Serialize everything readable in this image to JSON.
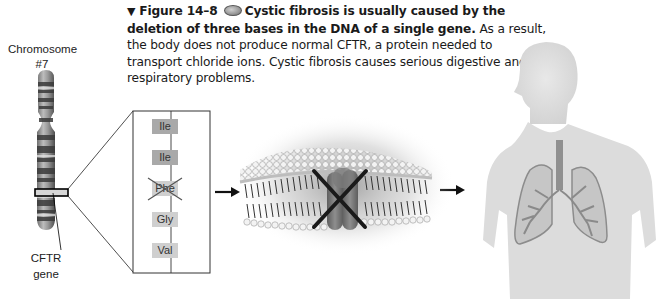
{
  "caption": {
    "marker": "▼",
    "figure_label": "Figure 14–8",
    "icon": "lens-icon",
    "bold_text": "Cystic fibrosis is usually caused by the deletion of three bases in the DNA of a single gene.",
    "body_text": " As a result, the body does not produce normal CFTR, a protein needed to transport chloride ions. Cystic fibrosis causes serious digestive and respiratory problems."
  },
  "chromosome": {
    "title_line1": "Chromosome",
    "title_line2": "#7",
    "gene_label_line1": "CFTR",
    "gene_label_line2": "gene"
  },
  "gene_panel": {
    "amino_acids": [
      {
        "label": "Ile",
        "deleted": false
      },
      {
        "label": "Ile",
        "deleted": false
      },
      {
        "label": "Phe",
        "deleted": true
      },
      {
        "label": "Gly",
        "deleted": false
      },
      {
        "label": "Val",
        "deleted": false
      }
    ]
  },
  "membrane": {
    "description": "cell membrane lipid bilayer with crossed-out CFTR channel protein"
  },
  "body": {
    "description": "human torso with lungs and airways"
  },
  "colors": {
    "text": "#1a1a1a",
    "aa_dark": "#a9a9a9",
    "aa_light": "#cfcfcf",
    "cross": "#1a1a1a"
  }
}
